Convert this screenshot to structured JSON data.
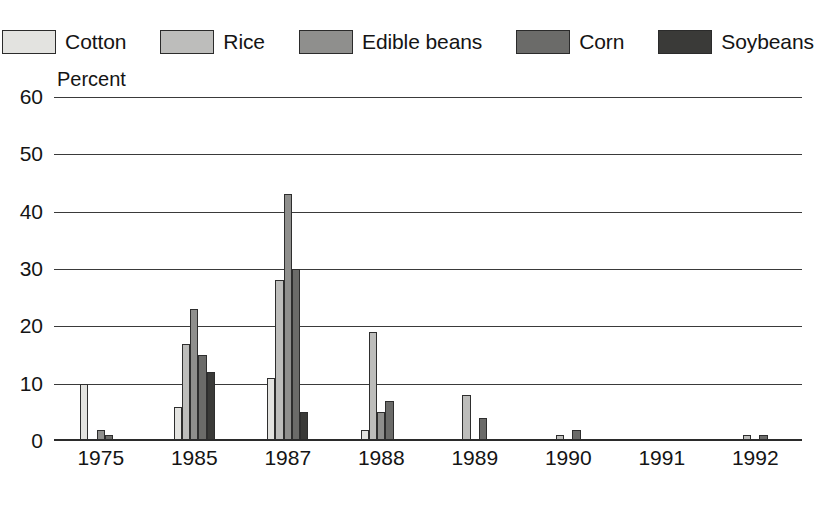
{
  "chart_data": {
    "type": "bar",
    "title": "",
    "xlabel": "",
    "ylabel": "Percent",
    "ylim": [
      0,
      60
    ],
    "yticks": [
      0,
      10,
      20,
      30,
      40,
      50,
      60
    ],
    "grid": true,
    "legend_position": "top",
    "categories": [
      "1975",
      "1985",
      "1987",
      "1988",
      "1989",
      "1990",
      "1991",
      "1992"
    ],
    "series": [
      {
        "name": "Cotton",
        "color": "#e3e3e0",
        "values": [
          10,
          6,
          11,
          2,
          0,
          0,
          0,
          0
        ]
      },
      {
        "name": "Rice",
        "color": "#bdbdbb",
        "values": [
          0,
          17,
          28,
          19,
          8,
          1,
          0,
          1
        ]
      },
      {
        "name": "Edible beans",
        "color": "#8f8f8d",
        "values": [
          2,
          23,
          43,
          5,
          0,
          0,
          0,
          0
        ]
      },
      {
        "name": "Corn",
        "color": "#6b6b69",
        "values": [
          1,
          15,
          30,
          7,
          4,
          2,
          0,
          1
        ]
      },
      {
        "name": "Soybeans",
        "color": "#3a3a38",
        "values": [
          0,
          12,
          5,
          0,
          0,
          0,
          0,
          0
        ]
      }
    ]
  },
  "legend": {
    "items": [
      {
        "label": "Cotton"
      },
      {
        "label": "Rice"
      },
      {
        "label": "Edible beans"
      },
      {
        "label": "Corn"
      },
      {
        "label": "Soybeans"
      }
    ]
  },
  "axis": {
    "y_title": "Percent",
    "y_labels": [
      "60",
      "50",
      "40",
      "30",
      "20",
      "10",
      "0"
    ],
    "x_labels": [
      "1975",
      "1985",
      "1987",
      "1988",
      "1989",
      "1990",
      "1991",
      "1992"
    ]
  }
}
